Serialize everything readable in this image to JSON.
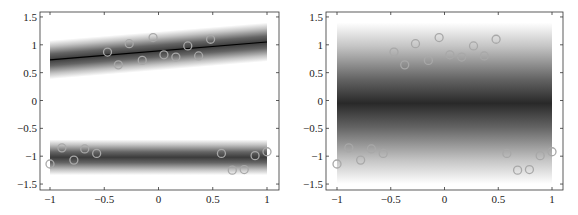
{
  "chart_data": [
    {
      "type": "scatter",
      "title": "",
      "xlabel": "",
      "ylabel": "",
      "xlim": [
        -1.05,
        1.05
      ],
      "ylim": [
        -1.6,
        1.6
      ],
      "xticks": [
        "-1",
        "-0.5",
        "0",
        "0.5",
        "1"
      ],
      "yticks": [
        "-1.5",
        "-1",
        "-0.5",
        "0",
        "0.5",
        "1",
        "1.5"
      ],
      "xtick_values": [
        -1,
        -0.5,
        0,
        0.5,
        1
      ],
      "ytick_values": [
        -1.5,
        -1,
        -0.5,
        0,
        0.5,
        1,
        1.5
      ],
      "grid": false,
      "background": "two grayscale density bands (upper band along fitted line, lower band around y≈-1)",
      "bands": [
        {
          "center_start": [
            -1,
            0.73
          ],
          "center_end": [
            1,
            1.05
          ],
          "halfwidth": 0.35,
          "has_line": true
        },
        {
          "center_start": [
            -1,
            -1.02
          ],
          "center_end": [
            1,
            -1.02
          ],
          "halfwidth": 0.32,
          "has_line": false
        }
      ],
      "line": {
        "x": [
          -1,
          1
        ],
        "y": [
          0.73,
          1.05
        ],
        "color": "#000000"
      },
      "points": {
        "x": [
          -0.47,
          -0.37,
          -0.27,
          -0.15,
          -0.05,
          0.05,
          0.16,
          0.27,
          0.37,
          0.48,
          -1.0,
          -0.89,
          -0.78,
          -0.68,
          -0.57,
          0.58,
          0.68,
          0.79,
          0.89,
          1.0
        ],
        "y": [
          0.87,
          0.64,
          1.02,
          0.72,
          1.13,
          0.82,
          0.78,
          0.98,
          0.8,
          1.1,
          -1.14,
          -0.85,
          -1.07,
          -0.87,
          -0.95,
          -0.95,
          -1.25,
          -1.24,
          -0.99,
          -0.92
        ],
        "marker": "circle-open",
        "color": "#a8a8a8"
      }
    },
    {
      "type": "scatter",
      "title": "",
      "xlabel": "",
      "ylabel": "",
      "xlim": [
        -1.05,
        1.05
      ],
      "ylim": [
        -1.6,
        1.6
      ],
      "xticks": [
        "-1",
        "-0.5",
        "0",
        "0.5",
        "1"
      ],
      "yticks": [
        "-1.5",
        "-1",
        "-0.5",
        "0",
        "0.5",
        "1",
        "1.5"
      ],
      "xtick_values": [
        -1,
        -0.5,
        0,
        0.5,
        1
      ],
      "ytick_values": [
        -1.5,
        -1,
        -0.5,
        0,
        0.5,
        1,
        1.5
      ],
      "grid": false,
      "background": "single broad grayscale density band centered near y≈0 spanning y∈[-1.5,1.4]",
      "bands": [
        {
          "center_start": [
            -1,
            -0.05
          ],
          "center_end": [
            1,
            -0.05
          ],
          "halfwidth": 1.45,
          "has_line": false
        }
      ],
      "points": {
        "x": [
          -0.47,
          -0.37,
          -0.27,
          -0.15,
          -0.05,
          0.05,
          0.16,
          0.27,
          0.37,
          0.48,
          -1.0,
          -0.89,
          -0.78,
          -0.68,
          -0.57,
          0.58,
          0.68,
          0.79,
          0.89,
          1.0
        ],
        "y": [
          0.87,
          0.64,
          1.02,
          0.72,
          1.13,
          0.82,
          0.78,
          0.98,
          0.8,
          1.1,
          -1.14,
          -0.85,
          -1.07,
          -0.87,
          -0.95,
          -0.95,
          -1.25,
          -1.24,
          -0.99,
          -0.92
        ],
        "marker": "circle-open",
        "color": "#a8a8a8"
      }
    }
  ]
}
